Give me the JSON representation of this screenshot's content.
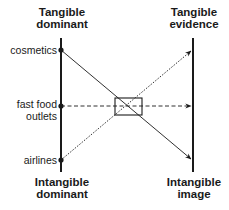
{
  "diagram": {
    "left_axis": {
      "top_label": [
        "Tangible",
        "dominant"
      ],
      "bottom_label": [
        "Intangible",
        "dominant"
      ]
    },
    "right_axis": {
      "top_label": [
        "Tangible",
        "evidence"
      ],
      "bottom_label": [
        "Intangible",
        "image"
      ]
    },
    "items": [
      {
        "label": [
          "cosmetics"
        ],
        "arrow_style": "solid",
        "points_to": "Intangible image"
      },
      {
        "label": [
          "fast food",
          "outlets"
        ],
        "arrow_style": "dashed",
        "points_to": "middle"
      },
      {
        "label": [
          "airlines"
        ],
        "arrow_style": "dotted",
        "points_to": "Tangible evidence"
      }
    ],
    "colors": {
      "line": "#1a1a1a",
      "text": "#1a1a1a",
      "background": "#ffffff"
    }
  }
}
